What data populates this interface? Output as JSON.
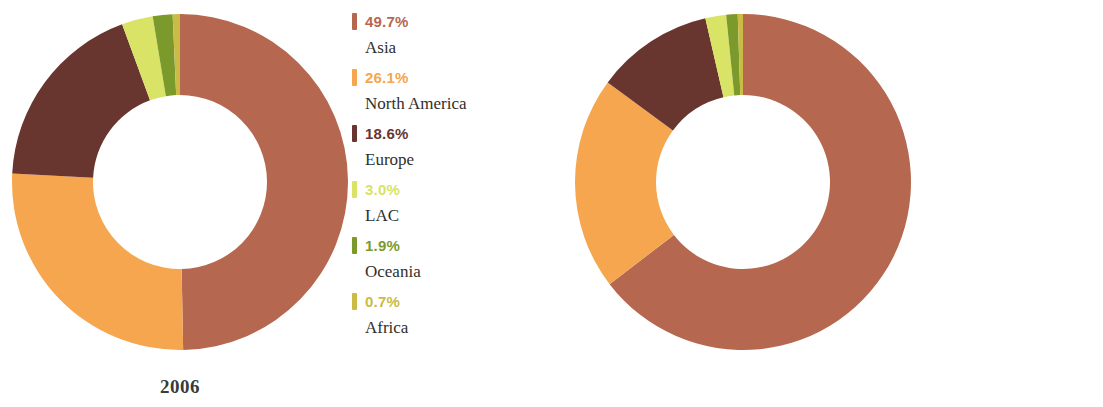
{
  "colors": {
    "asia": "#b5674f",
    "north_america": "#f5a64f",
    "europe": "#69352f",
    "lac": "#d9e366",
    "oceania": "#7c9a2c",
    "africa": "#c9bb46",
    "text_dark": "#2f2f2d",
    "background": "#ffffff"
  },
  "panels": [
    {
      "year": "2006",
      "legend": [
        {
          "pct": "49.7%",
          "region": "Asia",
          "color": "#b5674f",
          "swatch_icon": "legend-swatch-icon"
        },
        {
          "pct": "26.1%",
          "region": "North America",
          "color": "#f5a64f",
          "swatch_icon": "legend-swatch-icon"
        },
        {
          "pct": "18.6%",
          "region": "Europe",
          "color": "#69352f",
          "swatch_icon": "legend-swatch-icon"
        },
        {
          "pct": "3.0%",
          "region": "LAC",
          "color": "#d9e366",
          "swatch_icon": "legend-swatch-icon"
        },
        {
          "pct": "1.9%",
          "region": "Oceania",
          "color": "#7c9a2c",
          "swatch_icon": "legend-swatch-icon"
        },
        {
          "pct": "0.7%",
          "region": "Africa",
          "color": "#c9bb46",
          "swatch_icon": "legend-swatch-icon"
        }
      ]
    },
    {
      "year": "2016",
      "legend": [
        {
          "pct": "64.6%",
          "region": "Asia",
          "color": "#b5674f",
          "swatch_icon": "legend-swatch-icon"
        },
        {
          "pct": "20.5%",
          "region": "North America",
          "color": "#f5a64f",
          "swatch_icon": "legend-swatch-icon"
        },
        {
          "pct": "11.3%",
          "region": "Europe",
          "color": "#69352f",
          "swatch_icon": "legend-swatch-icon"
        },
        {
          "pct": "2.0%",
          "region": "LAC",
          "color": "#d9e366",
          "swatch_icon": "legend-swatch-icon"
        },
        {
          "pct": "1.1%",
          "region": "Oceania",
          "color": "#7c9a2c",
          "swatch_icon": "legend-swatch-icon"
        },
        {
          "pct": "0.5%",
          "region": "Africa",
          "color": "#c9bb46",
          "swatch_icon": "legend-swatch-icon"
        }
      ]
    }
  ],
  "chart_data": [
    {
      "type": "pie",
      "variant": "donut",
      "title": "2006",
      "xlabel": "",
      "ylabel": "",
      "legend_position": "right",
      "grid": false,
      "start_angle_deg": 0,
      "direction": "clockwise",
      "labels": [
        "Asia",
        "North America",
        "Europe",
        "LAC",
        "Oceania",
        "Africa"
      ],
      "values": [
        49.7,
        26.1,
        18.6,
        3.0,
        1.9,
        0.7
      ],
      "value_labels": [
        "49.7%",
        "26.1%",
        "18.6%",
        "3.0%",
        "1.9%",
        "0.7%"
      ],
      "colors": [
        "#b5674f",
        "#f5a64f",
        "#69352f",
        "#d9e366",
        "#7c9a2c",
        "#c9bb46"
      ],
      "units": "percent",
      "total": 100.0,
      "inner_radius_ratio": 0.52
    },
    {
      "type": "pie",
      "variant": "donut",
      "title": "2016",
      "xlabel": "",
      "ylabel": "",
      "legend_position": "right",
      "grid": false,
      "start_angle_deg": 0,
      "direction": "clockwise",
      "labels": [
        "Asia",
        "North America",
        "Europe",
        "LAC",
        "Oceania",
        "Africa"
      ],
      "values": [
        64.6,
        20.5,
        11.3,
        2.0,
        1.1,
        0.5
      ],
      "value_labels": [
        "64.6%",
        "20.5%",
        "11.3%",
        "2.0%",
        "1.1%",
        "0.5%"
      ],
      "colors": [
        "#b5674f",
        "#f5a64f",
        "#69352f",
        "#d9e366",
        "#7c9a2c",
        "#c9bb46"
      ],
      "units": "percent",
      "total": 100.0,
      "inner_radius_ratio": 0.52
    }
  ]
}
